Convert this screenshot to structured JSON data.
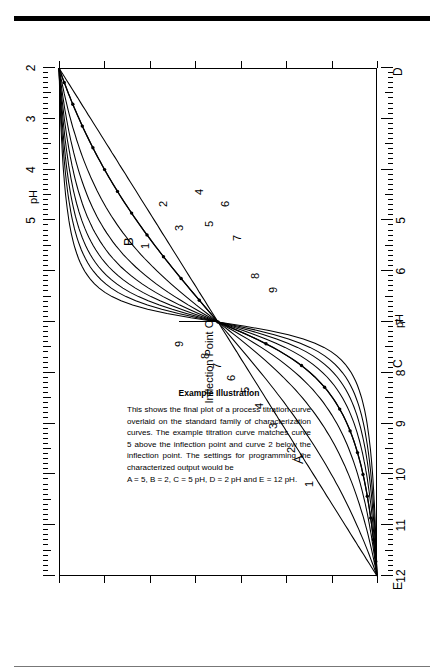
{
  "figure": {
    "orientation": "rotated-90",
    "axis_name": "pH"
  },
  "caption": {
    "heading": "Example Illustration",
    "body": "This shows the final plot of a process titration curve overlaid on the standard family of characterization curves. The example titration curve matches curve 5 above the inflection point and curve 2 below the inflection point. The settings for programming the characterized output would be",
    "settings": "A = 5, B = 2, C = 5 pH, D = 2 pH and E = 12 pH."
  },
  "annotations": {
    "inflection": "Inflection Point C",
    "region_upper": "A",
    "region_lower": "B",
    "point_e": "E",
    "point_c": "C",
    "point_d": "D"
  },
  "chart_data": {
    "type": "line",
    "xlabel": "pH",
    "ylabel": "",
    "xlim": [
      12,
      2
    ],
    "grid": false,
    "legend": "inline curve numbers 1-9",
    "axis_bottom_ticks": [
      "12",
      "11",
      "10",
      "9",
      "8",
      "7",
      "6",
      "5"
    ],
    "axis_top_ticks": [
      "5",
      "4",
      "3",
      "2"
    ],
    "inflection_ph": 5,
    "curve_numbers": [
      "1",
      "2",
      "3",
      "4",
      "5",
      "6",
      "7",
      "8",
      "9"
    ],
    "markers": {
      "A": 5,
      "B": 2,
      "C": "5 pH",
      "D": "2 pH",
      "E": "12 pH"
    },
    "series": [
      {
        "name": "1",
        "curvature": 0.0
      },
      {
        "name": "2",
        "curvature": 0.14
      },
      {
        "name": "3",
        "curvature": 0.27
      },
      {
        "name": "4",
        "curvature": 0.39
      },
      {
        "name": "5",
        "curvature": 0.5
      },
      {
        "name": "6",
        "curvature": 0.6
      },
      {
        "name": "7",
        "curvature": 0.69
      },
      {
        "name": "8",
        "curvature": 0.77
      },
      {
        "name": "9",
        "curvature": 0.85
      },
      {
        "name": "process titration curve",
        "upper_match": 5,
        "lower_match": 2
      }
    ]
  }
}
